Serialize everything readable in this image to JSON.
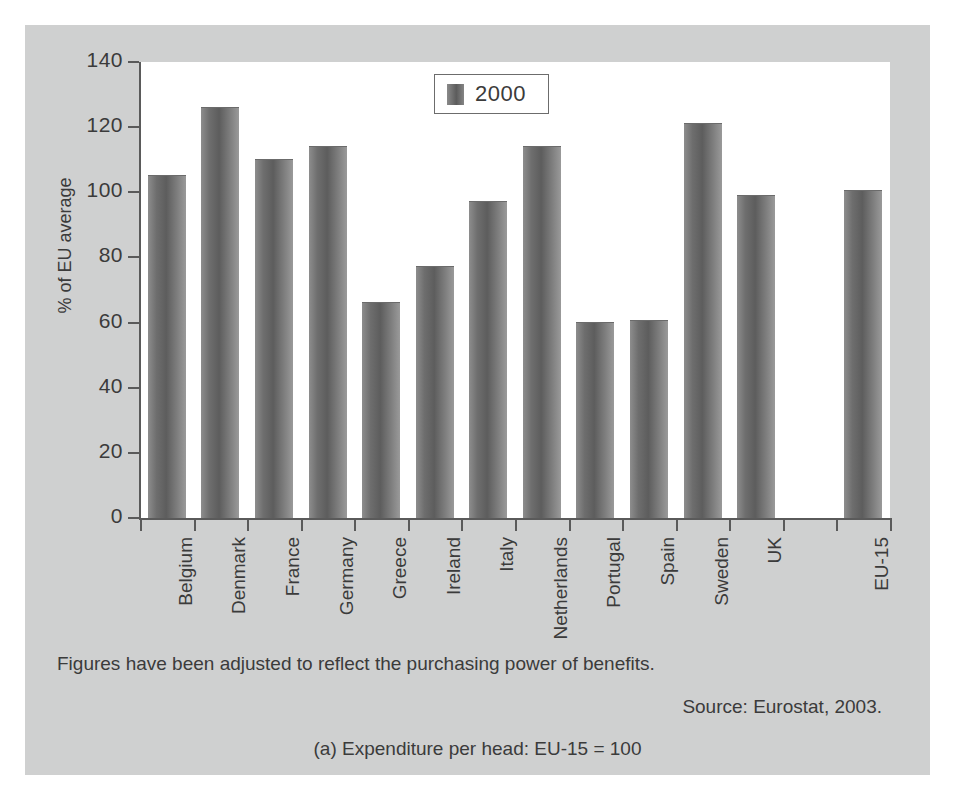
{
  "chart_data": {
    "type": "bar",
    "title": "",
    "xlabel": "",
    "ylabel": "% of EU average",
    "ylim": [
      0,
      140
    ],
    "yticks": [
      0,
      20,
      40,
      60,
      80,
      100,
      120,
      140
    ],
    "grid": false,
    "legend_position": "top-center",
    "categories": [
      "Belgium",
      "Denmark",
      "France",
      "Germany",
      "Greece",
      "Ireland",
      "Italy",
      "Netherlands",
      "Portugal",
      "Spain",
      "Sweden",
      "UK",
      "",
      "EU-15"
    ],
    "series": [
      {
        "name": "2000",
        "values": [
          105,
          126,
          110,
          114,
          66,
          77,
          97,
          114,
          60,
          60.5,
          121,
          99,
          null,
          100.5
        ]
      }
    ]
  },
  "legend": {
    "entries": [
      {
        "label": "2000",
        "swatch": "bar-swatch"
      }
    ]
  },
  "notes": {
    "footnote": "Figures have been adjusted to reflect the purchasing power of benefits.",
    "source": "Source: Eurostat, 2003.",
    "caption": "(a) Expenditure per head: EU-15 = 100"
  },
  "colors": {
    "figure_background": "#cfd0d0",
    "plot_background": "#ffffff",
    "axis": "#5a5a5a",
    "text": "#3b3b3b",
    "bar_dark": "#5d5d5d",
    "bar_light": "#9a9a9a"
  }
}
